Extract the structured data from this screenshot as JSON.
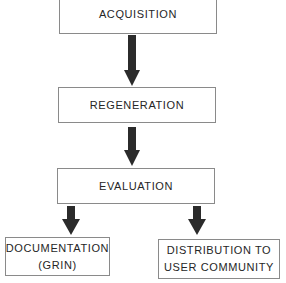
{
  "diagram": {
    "type": "flowchart",
    "nodes": [
      {
        "id": "acquisition",
        "lines": [
          "ACQUISITION"
        ]
      },
      {
        "id": "regeneration",
        "lines": [
          "REGENERATION"
        ]
      },
      {
        "id": "evaluation",
        "lines": [
          "EVALUATION"
        ]
      },
      {
        "id": "documentation",
        "lines": [
          "DOCUMENTATION",
          "(GRIN)"
        ]
      },
      {
        "id": "distribution",
        "lines": [
          "DISTRIBUTION TO",
          "USER COMMUNITY"
        ]
      }
    ],
    "edges": [
      {
        "from": "acquisition",
        "to": "regeneration"
      },
      {
        "from": "regeneration",
        "to": "evaluation"
      },
      {
        "from": "evaluation",
        "to": "documentation"
      },
      {
        "from": "evaluation",
        "to": "distribution"
      }
    ],
    "colors": {
      "arrow": "#2b2b2b",
      "border": "#8a8a8a",
      "text": "#262626"
    }
  }
}
